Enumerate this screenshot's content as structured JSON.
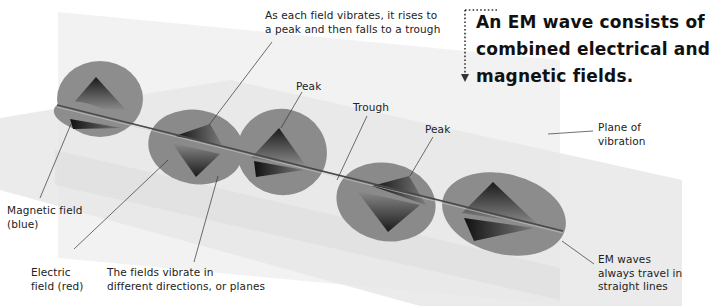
{
  "headline": {
    "lines": [
      "An EM wave consists of",
      "combined electrical and",
      "magnetic fields."
    ],
    "pointer": "dotted-arrow-down"
  },
  "labels": {
    "vibrates": [
      "As each field vibrates, it rises to",
      "a peak and then falls to a trough"
    ],
    "peak_1": "Peak",
    "trough": "Trough",
    "peak_2": "Peak",
    "plane_of_vibration": [
      "Plane of",
      "vibration"
    ],
    "magnetic_field": [
      "Magnetic field",
      "(blue)"
    ],
    "electric_field": [
      "Electric",
      "field (red)"
    ],
    "fields_vibrate": [
      "The fields vibrate in",
      "different directions, or planes"
    ],
    "straight_lines": [
      "EM waves",
      "always travel in",
      "straight lines"
    ]
  },
  "colors": {
    "background": "#ffffff",
    "vertical_plane": "#f1f1f1",
    "horizontal_plane": "#e6e6e6",
    "lobe_fill": "#8c8c8c",
    "lobe_dark": "#1e1e1e",
    "axis": "#4a4a4a",
    "leader_line": "#333333",
    "text": "#1a1a1a"
  }
}
